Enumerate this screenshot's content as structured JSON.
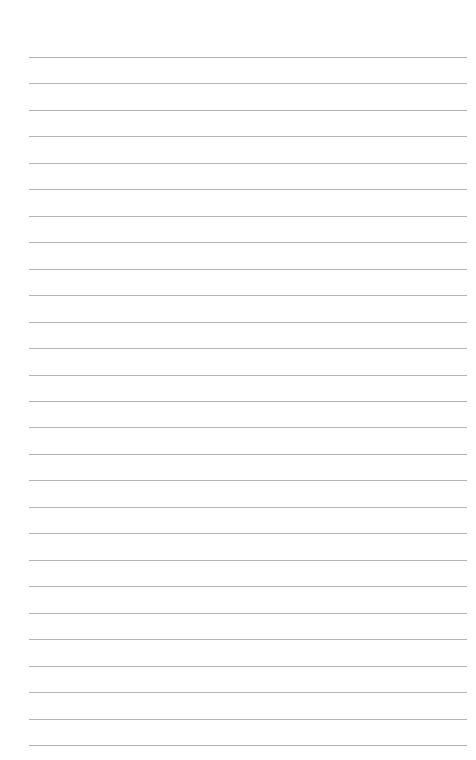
{
  "page": {
    "type": "lined-paper",
    "background_color": "#ffffff",
    "line_color": "#b4b4b4",
    "line_count": 27,
    "first_line_y": 57,
    "line_spacing": 26.46,
    "line_left": 29,
    "line_right": 467
  }
}
